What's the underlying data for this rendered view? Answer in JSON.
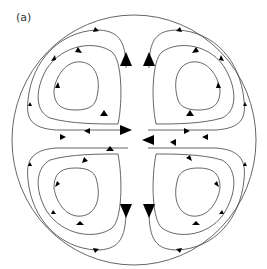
{
  "figure": {
    "panel_label": "(a)",
    "colors": {
      "line": "#555555",
      "arrow": "#000000",
      "background": "#ffffff"
    },
    "cells": [
      {
        "position": "top-left",
        "rotation": "clockwise",
        "streamlines": 3
      },
      {
        "position": "top-right",
        "rotation": "counterclockwise",
        "streamlines": 3
      },
      {
        "position": "bottom-left",
        "rotation": "counterclockwise",
        "streamlines": 3
      },
      {
        "position": "bottom-right",
        "rotation": "clockwise",
        "streamlines": 3
      }
    ],
    "central_flow": {
      "vertical_center": "upward in upper half, downward in lower half",
      "horizontal_midline": "inward from left and right walls"
    }
  }
}
